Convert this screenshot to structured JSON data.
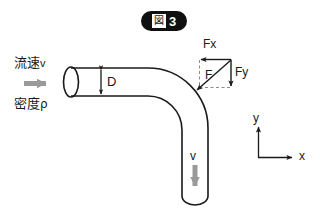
{
  "figure": {
    "title_glyph": "図",
    "title_number": "3",
    "title_full": "図 3"
  },
  "annotations": {
    "velocity_inlet": {
      "jp": "流速",
      "symbol": "v"
    },
    "density": {
      "jp": "密度",
      "symbol": "ρ"
    },
    "diameter": "D",
    "force_x": "Fx",
    "force_y": "Fy",
    "force_resultant": "F",
    "velocity_outlet": "v"
  },
  "axes": {
    "y_label": "y",
    "x_label": "x"
  },
  "icons": {
    "inlet_flow_arrow": "arrow-right-icon",
    "outlet_flow_arrow": "arrow-down-icon",
    "dimension_arrow": "double-arrow-vertical-icon",
    "fx_arrow": "arrow-left-icon",
    "fy_arrow": "arrow-down-icon",
    "f_arrow": "arrow-diagonal-down-left-icon",
    "axis_y_arrow": "arrow-up-icon",
    "axis_x_arrow": "arrow-right-icon"
  },
  "colors": {
    "stroke": "#1a1a1a",
    "flow_arrow": "#9a9a9a",
    "guide_dash": "#8c8c8c",
    "badge_bg": "#101010",
    "badge_text": "#ffffff",
    "background": "#ffffff"
  },
  "geometry": {
    "pipe_inner_diameter_px": 28,
    "bend_angle_deg": 90,
    "inlet_direction": "right",
    "outlet_direction": "down"
  }
}
